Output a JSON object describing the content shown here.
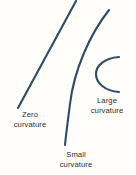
{
  "figure": {
    "background_color": "#fffefb",
    "stroke_color": "#2c4c6b",
    "text_color": "#2e2e2e",
    "labels": {
      "zero": {
        "line1": "Zero",
        "line2": "curvature"
      },
      "small": {
        "line1": "Small",
        "line2": "curvature"
      },
      "large": {
        "line1": "Large",
        "line2": "curvature"
      }
    }
  },
  "chart_data": {
    "type": "line",
    "title": "",
    "xlabel": "",
    "ylabel": "",
    "grid": false,
    "legend": "none",
    "annotations": [
      {
        "text": "Zero curvature",
        "x": 30,
        "y": 119
      },
      {
        "text": "Small curvature",
        "x": 76,
        "y": 159
      },
      {
        "text": "Large curvature",
        "x": 107,
        "y": 105
      }
    ],
    "series": [
      {
        "name": "Zero curvature",
        "shape": "straight-line",
        "curvature": 0,
        "path": "M 76 1 L 18 108"
      },
      {
        "name": "Small curvature",
        "shape": "gentle-arc",
        "curvature": 0.02,
        "path": "M 109 10 C 90 34 74 70 70 104 C 68 120 66 134 65 145"
      },
      {
        "name": "Large curvature",
        "shape": "c-arc",
        "curvature": 0.08,
        "path": "M 119 57 C 104 58 96 66 96 74 C 96 83 105 91 119 92"
      }
    ]
  }
}
